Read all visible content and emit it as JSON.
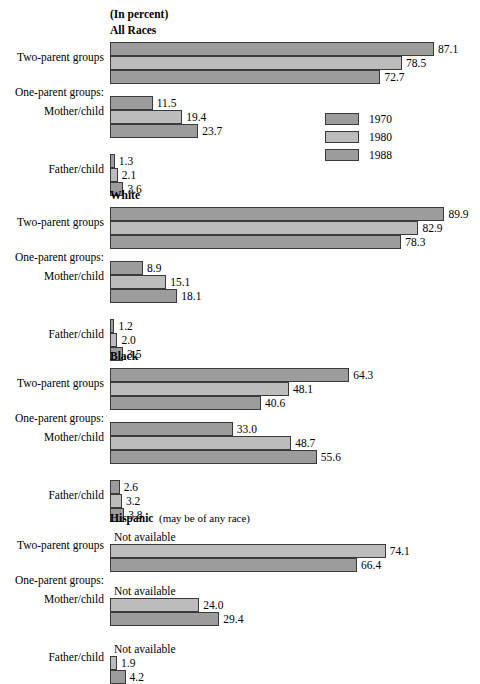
{
  "header": {
    "units": "(In percent)"
  },
  "legend": {
    "position": "right-middle-upper",
    "entries": [
      {
        "label": "1970",
        "color": "#9c9c9c"
      },
      {
        "label": "1980",
        "color": "#bcbcbc"
      },
      {
        "label": "1988",
        "color": "#9c9c9c"
      }
    ]
  },
  "axis": {
    "origin_x": 110,
    "px_per_percent": 3.72,
    "bar_height": 14,
    "not_available_text": "Not available"
  },
  "categories": [
    "Two-parent groups",
    "One-parent groups:",
    "Mother/child",
    "Father/child"
  ],
  "chart_data": {
    "type": "bar",
    "orientation": "horizontal",
    "title": "",
    "subtitle": "(In percent)",
    "xlabel": "",
    "ylabel": "",
    "grid": false,
    "xlim": [
      0,
      100
    ],
    "legend_position": "right",
    "series": [
      {
        "name": "1970",
        "color": "#9c9c9c"
      },
      {
        "name": "1980",
        "color": "#bcbcbc"
      },
      {
        "name": "1988",
        "color": "#9c9c9c"
      }
    ],
    "panels": [
      {
        "name": "All Races",
        "title": "All Races",
        "note": "",
        "groups": [
          {
            "category": "Two-parent groups",
            "values": [
              87.1,
              78.5,
              72.7
            ],
            "labels": [
              "87.1",
              "78.5",
              "72.7"
            ]
          },
          {
            "category": "Mother/child",
            "values": [
              11.5,
              19.4,
              23.7
            ],
            "labels": [
              "11.5",
              "19.4",
              "23.7"
            ]
          },
          {
            "category": "Father/child",
            "values": [
              1.3,
              2.1,
              3.6
            ],
            "labels": [
              "1.3",
              "2.1",
              "3.6"
            ]
          }
        ]
      },
      {
        "name": "White",
        "title": "White",
        "note": "",
        "groups": [
          {
            "category": "Two-parent groups",
            "values": [
              89.9,
              82.9,
              78.3
            ],
            "labels": [
              "89.9",
              "82.9",
              "78.3"
            ]
          },
          {
            "category": "Mother/child",
            "values": [
              8.9,
              15.1,
              18.1
            ],
            "labels": [
              "8.9",
              "15.1",
              "18.1"
            ]
          },
          {
            "category": "Father/child",
            "values": [
              1.2,
              2.0,
              3.5
            ],
            "labels": [
              "1.2",
              "2.0",
              "3.5"
            ]
          }
        ]
      },
      {
        "name": "Black",
        "title": "Black",
        "note": "",
        "groups": [
          {
            "category": "Two-parent groups",
            "values": [
              64.3,
              48.1,
              40.6
            ],
            "labels": [
              "64.3",
              "48.1",
              "40.6"
            ]
          },
          {
            "category": "Mother/child",
            "values": [
              33.0,
              48.7,
              55.6
            ],
            "labels": [
              "33.0",
              "48.7",
              "55.6"
            ]
          },
          {
            "category": "Father/child",
            "values": [
              2.6,
              3.2,
              3.8
            ],
            "labels": [
              "2.6",
              "3.2",
              "3.8"
            ]
          }
        ]
      },
      {
        "name": "Hispanic",
        "title": "Hispanic",
        "note": "(may be of any race)",
        "groups": [
          {
            "category": "Two-parent groups",
            "values": [
              null,
              74.1,
              66.4
            ],
            "labels": [
              "Not available",
              "74.1",
              "66.4"
            ]
          },
          {
            "category": "Mother/child",
            "values": [
              null,
              24.0,
              29.4
            ],
            "labels": [
              "Not available",
              "24.0",
              "29.4"
            ]
          },
          {
            "category": "Father/child",
            "values": [
              null,
              1.9,
              4.2
            ],
            "labels": [
              "Not available",
              "1.9",
              "4.2"
            ]
          }
        ]
      }
    ]
  }
}
